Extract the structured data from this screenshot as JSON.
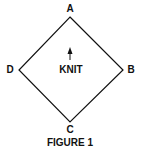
{
  "figure": {
    "caption": "FIGURE 1",
    "center_label": "KNIT",
    "direction_arrow": "up-arrow-icon",
    "vertices": {
      "top": "A",
      "right": "B",
      "bottom": "C",
      "left": "D"
    },
    "stroke_color": "#111111"
  }
}
